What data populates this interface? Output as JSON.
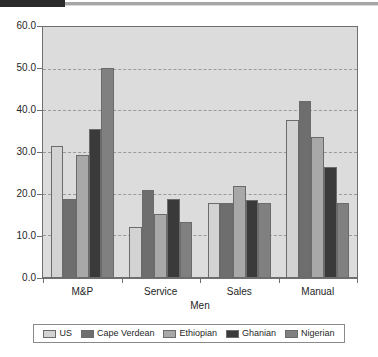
{
  "header": {
    "rule_dark_color": "#2b2b2b",
    "rule_light_color": "#a6a6a6"
  },
  "chart_data": {
    "type": "bar",
    "title": "",
    "xlabel": "Men",
    "ylabel": "",
    "categories": [
      "M&P",
      "Service",
      "Sales",
      "Manual"
    ],
    "ylim": [
      0.0,
      60.0
    ],
    "ytick_labels": [
      "60.0",
      "50.0",
      "40.0",
      "30.0",
      "20.0",
      "10.0",
      "0.0"
    ],
    "ytick_values": [
      60.0,
      50.0,
      40.0,
      30.0,
      20.0,
      10.0,
      0.0
    ],
    "grid": true,
    "grid_style": "dashed-horizontal",
    "legend_position": "bottom",
    "plot_background": "#dcdcdc",
    "series": [
      {
        "name": "US",
        "color": "#d3d3d3",
        "values": [
          31.5,
          12.2,
          18.0,
          37.7
        ]
      },
      {
        "name": "Cape Verdean",
        "color": "#6e6e6e",
        "values": [
          19.0,
          21.0,
          18.0,
          42.4
        ]
      },
      {
        "name": "Ethiopian",
        "color": "#a8a8a8",
        "values": [
          29.3,
          15.2,
          22.0,
          33.8
        ]
      },
      {
        "name": "Ghanian",
        "color": "#3a3a3a",
        "values": [
          35.7,
          18.8,
          18.7,
          26.6
        ]
      },
      {
        "name": "Nigerian",
        "color": "#808080",
        "values": [
          50.2,
          13.5,
          18.0,
          18.0
        ]
      }
    ]
  }
}
